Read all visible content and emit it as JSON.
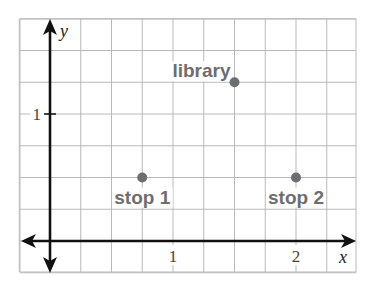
{
  "chart_data": {
    "type": "scatter",
    "title": "",
    "xlabel": "x",
    "ylabel": "y",
    "xlim": [
      -0.25,
      2.5
    ],
    "ylim": [
      -0.25,
      1.75
    ],
    "grid": true,
    "grid_step": 0.25,
    "x_ticks": [
      {
        "value": 1,
        "label": "1"
      },
      {
        "value": 2,
        "label": "2"
      }
    ],
    "y_ticks": [
      {
        "value": 1,
        "label": "1"
      }
    ],
    "points": [
      {
        "name": "stop 1",
        "x": 0.75,
        "y": 0.5,
        "label": "stop 1",
        "label_position": "below"
      },
      {
        "name": "library",
        "x": 1.5,
        "y": 1.25,
        "label": "library",
        "label_position": "above-left"
      },
      {
        "name": "stop 2",
        "x": 2,
        "y": 0.5,
        "label": "stop 2",
        "label_position": "below"
      }
    ]
  },
  "colors": {
    "grid": "#b9b9b9",
    "axis": "#111111",
    "point": "#6d6e71",
    "label": "#6d6e71"
  }
}
